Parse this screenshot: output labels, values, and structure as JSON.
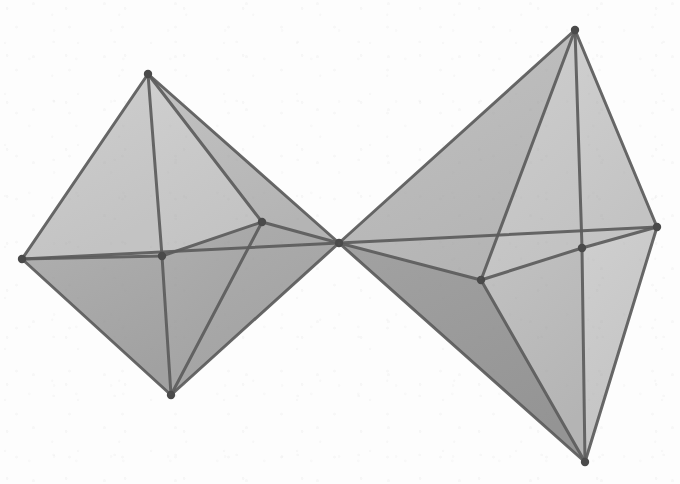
{
  "figure": {
    "kind": "geometric-line-drawing",
    "medium": "scanned grayscale illustration",
    "canvas": {
      "width": 680,
      "height": 484
    },
    "background_color": "#fdfdfd",
    "edge_color": "#5c5c5c",
    "vertex_color": "#4a4a4a",
    "edge_width": 3.0,
    "hidden_edge_width": 2.2,
    "vertex_radius": 4.2,
    "face_fills": {
      "light": "#c9c9c9",
      "mid": "#bdbdbd",
      "dark": "#a8a8a8",
      "darker": "#9c9c9c"
    },
    "solids": [
      {
        "name": "left-octahedron",
        "label": "left octahedron",
        "vertices": [
          {
            "id": "L-top",
            "name": "top-apex",
            "x": 148,
            "y": 74
          },
          {
            "id": "L-left",
            "name": "left-equator",
            "x": 22,
            "y": 259
          },
          {
            "id": "L-bottom",
            "name": "bottom-apex",
            "x": 171,
            "y": 395
          },
          {
            "id": "L-near",
            "name": "near-equator",
            "x": 262,
            "y": 222
          },
          {
            "id": "L-far",
            "name": "far-equator",
            "x": 162,
            "y": 256
          },
          {
            "id": "L-right",
            "name": "shared-vertex",
            "x": 339,
            "y": 243
          }
        ],
        "faces": [
          {
            "name": "upper-left-face",
            "verts": [
              "L-top",
              "L-left",
              "L-far"
            ],
            "fill": "light"
          },
          {
            "name": "upper-front-face",
            "verts": [
              "L-top",
              "L-far",
              "L-near"
            ],
            "fill": "light"
          },
          {
            "name": "upper-right-face",
            "verts": [
              "L-top",
              "L-near",
              "L-right"
            ],
            "fill": "mid"
          },
          {
            "name": "lower-left-face",
            "verts": [
              "L-bottom",
              "L-left",
              "L-far"
            ],
            "fill": "dark"
          },
          {
            "name": "lower-front-face",
            "verts": [
              "L-bottom",
              "L-far",
              "L-near"
            ],
            "fill": "dark"
          },
          {
            "name": "lower-right-face",
            "verts": [
              "L-bottom",
              "L-near",
              "L-right"
            ],
            "fill": "dark"
          }
        ],
        "edges": [
          [
            "L-top",
            "L-left"
          ],
          [
            "L-top",
            "L-far"
          ],
          [
            "L-top",
            "L-near"
          ],
          [
            "L-top",
            "L-right"
          ],
          [
            "L-bottom",
            "L-left"
          ],
          [
            "L-bottom",
            "L-far"
          ],
          [
            "L-bottom",
            "L-near"
          ],
          [
            "L-bottom",
            "L-right"
          ],
          [
            "L-left",
            "L-far"
          ],
          [
            "L-far",
            "L-near"
          ],
          [
            "L-near",
            "L-right"
          ],
          [
            "L-right",
            "L-left"
          ]
        ]
      },
      {
        "name": "right-octahedron",
        "label": "right octahedron",
        "vertices": [
          {
            "id": "R-left",
            "name": "shared-vertex",
            "x": 339,
            "y": 243
          },
          {
            "id": "R-top",
            "name": "top-apex",
            "x": 575,
            "y": 30
          },
          {
            "id": "R-right",
            "name": "right-equator",
            "x": 657,
            "y": 227
          },
          {
            "id": "R-bottom",
            "name": "bottom-apex",
            "x": 585,
            "y": 462
          },
          {
            "id": "R-near",
            "name": "near-equator",
            "x": 481,
            "y": 280
          },
          {
            "id": "R-far",
            "name": "far-equator",
            "x": 582,
            "y": 248
          }
        ],
        "faces": [
          {
            "name": "upper-back-face",
            "verts": [
              "R-top",
              "R-left",
              "R-far"
            ],
            "fill": "mid"
          },
          {
            "name": "upper-left-face",
            "verts": [
              "R-top",
              "R-left",
              "R-near"
            ],
            "fill": "mid"
          },
          {
            "name": "upper-front-face",
            "verts": [
              "R-top",
              "R-near",
              "R-far"
            ],
            "fill": "light"
          },
          {
            "name": "upper-right-face",
            "verts": [
              "R-top",
              "R-far",
              "R-right"
            ],
            "fill": "light"
          },
          {
            "name": "lower-left-face",
            "verts": [
              "R-bottom",
              "R-left",
              "R-near"
            ],
            "fill": "darker"
          },
          {
            "name": "lower-front-face",
            "verts": [
              "R-bottom",
              "R-near",
              "R-far"
            ],
            "fill": "mid"
          },
          {
            "name": "lower-right-face",
            "verts": [
              "R-bottom",
              "R-far",
              "R-right"
            ],
            "fill": "light"
          }
        ],
        "edges": [
          [
            "R-top",
            "R-left"
          ],
          [
            "R-top",
            "R-near"
          ],
          [
            "R-top",
            "R-far"
          ],
          [
            "R-top",
            "R-right"
          ],
          [
            "R-bottom",
            "R-left"
          ],
          [
            "R-bottom",
            "R-near"
          ],
          [
            "R-bottom",
            "R-far"
          ],
          [
            "R-bottom",
            "R-right"
          ],
          [
            "R-left",
            "R-near"
          ],
          [
            "R-near",
            "R-far"
          ],
          [
            "R-far",
            "R-right"
          ],
          [
            "R-right",
            "R-left"
          ]
        ]
      }
    ],
    "shared_vertex": {
      "name": "common-vertex",
      "x": 339,
      "y": 243
    }
  }
}
